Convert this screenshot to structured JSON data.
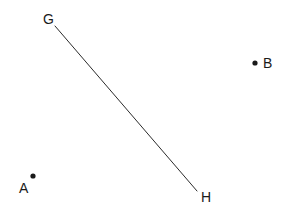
{
  "figure": {
    "width": 285,
    "height": 217,
    "background_color": "#ffffff",
    "stroke_color": "#2b2b2b",
    "point_color": "#1a1a1a",
    "label_color": "#1a1a1a",
    "line_width": 1
  },
  "chart_data": {
    "type": "scatter",
    "title": "",
    "xlabel": "",
    "ylabel": "",
    "grid": false,
    "legend": false,
    "xlim": [
      0,
      285
    ],
    "ylim": [
      0,
      217
    ],
    "points": [
      {
        "label": "A",
        "x": 33,
        "y": 176,
        "dot": true,
        "label_dx": -13,
        "label_dy": 12
      },
      {
        "label": "B",
        "x": 255,
        "y": 63,
        "dot": true,
        "label_dx": 9,
        "label_dy": 0
      },
      {
        "label": "G",
        "x": 55,
        "y": 26,
        "dot": false,
        "label_dx": -11,
        "label_dy": -7
      },
      {
        "label": "H",
        "x": 197,
        "y": 191,
        "dot": false,
        "label_dx": 6,
        "label_dy": 7
      }
    ],
    "segments": [
      {
        "name": "GH",
        "x1": 55,
        "y1": 26,
        "x2": 197,
        "y2": 191
      }
    ]
  },
  "labels": {
    "G": "G",
    "H": "H",
    "A": "A",
    "B": "B"
  }
}
